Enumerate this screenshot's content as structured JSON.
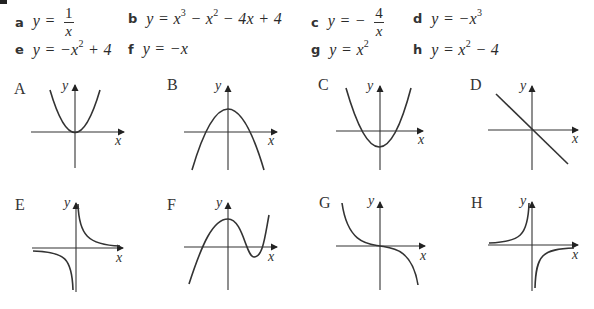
{
  "equations": [
    {
      "letter": "a",
      "lhs": "y =",
      "frac_num": "1",
      "frac_den": "x"
    },
    {
      "letter": "b",
      "lhs": "y = x",
      "sup1": "3",
      "mid1": " − x",
      "sup2": "2",
      "rest": " − 4x + 4"
    },
    {
      "letter": "c",
      "lhs": "y = −",
      "frac_num": "4",
      "frac_den": "x"
    },
    {
      "letter": "d",
      "lhs": "y = −x",
      "sup1": "3"
    },
    {
      "letter": "e",
      "lhs": "y = −x",
      "sup1": "2",
      "rest": " + 4"
    },
    {
      "letter": "f",
      "lhs": "y = −x"
    },
    {
      "letter": "g",
      "lhs": "y = x",
      "sup1": "2"
    },
    {
      "letter": "h",
      "lhs": "y = x",
      "sup1": "2",
      "rest": " − 4"
    }
  ],
  "graphs": [
    {
      "label": "A",
      "description": "parabola with vertex at origin, y = x^2",
      "axis_x": "x",
      "axis_y": "y"
    },
    {
      "label": "B",
      "description": "downward parabola with positive y-intercept crossing x-axis twice",
      "axis_x": "x",
      "axis_y": "y"
    },
    {
      "label": "C",
      "description": "upward parabola with negative y-intercept",
      "axis_x": "x",
      "axis_y": "y"
    },
    {
      "label": "D",
      "description": "straight line through origin with negative slope",
      "axis_x": "x",
      "axis_y": "y"
    },
    {
      "label": "E",
      "description": "hyperbola in quadrants I and III",
      "axis_x": "x",
      "axis_y": "y"
    },
    {
      "label": "F",
      "description": "cubic with local max above origin and local min right, positive leading coefficient",
      "axis_x": "x",
      "axis_y": "y"
    },
    {
      "label": "G",
      "description": "negative cubic through origin",
      "axis_x": "x",
      "axis_y": "y"
    },
    {
      "label": "H",
      "description": "hyperbola in quadrants II and IV",
      "axis_x": "x",
      "axis_y": "y"
    }
  ]
}
